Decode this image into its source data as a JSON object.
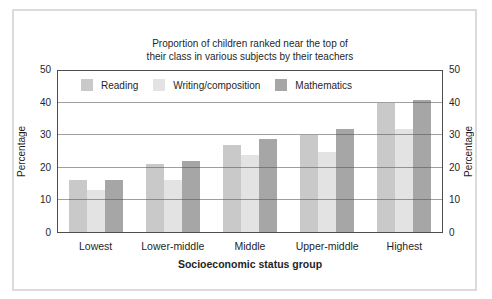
{
  "figure": {
    "title_line1": "Proportion of children ranked near the top of",
    "title_line2": "their class in various subjects by their teachers",
    "xlabel": "Socioeconomic status group",
    "ylabel_left": "Percentage",
    "ylabel_right": "Percentage"
  },
  "chart_data": {
    "type": "bar",
    "title": "Proportion of children ranked near the top of their class in various subjects by their teachers",
    "categories": [
      "Lowest",
      "Lower-middle",
      "Middle",
      "Upper-middle",
      "Highest"
    ],
    "series": [
      {
        "name": "Reading",
        "color": "#c9c9c9",
        "values": [
          16,
          21,
          27,
          30,
          40
        ]
      },
      {
        "name": "Writing/composition",
        "color": "#e3e3e3",
        "values": [
          13,
          16,
          24,
          25,
          32
        ]
      },
      {
        "name": "Mathematics",
        "color": "#a6a6a6",
        "values": [
          16,
          22,
          29,
          32,
          41
        ]
      }
    ],
    "xlabel": "Socioeconomic status group",
    "ylabel": "Percentage",
    "ylim": [
      0,
      50
    ],
    "yticks": [
      0,
      10,
      20,
      30,
      40,
      50
    ],
    "grid": true,
    "gridlines_over_bars": true,
    "legend_position": "inside-top-left",
    "duplicate_right_axis": true
  },
  "colors": {
    "axis": "#4d4d4d",
    "gridline": "#505050",
    "frame_border": "#dbdbdb",
    "text": "#1f1f1f"
  }
}
